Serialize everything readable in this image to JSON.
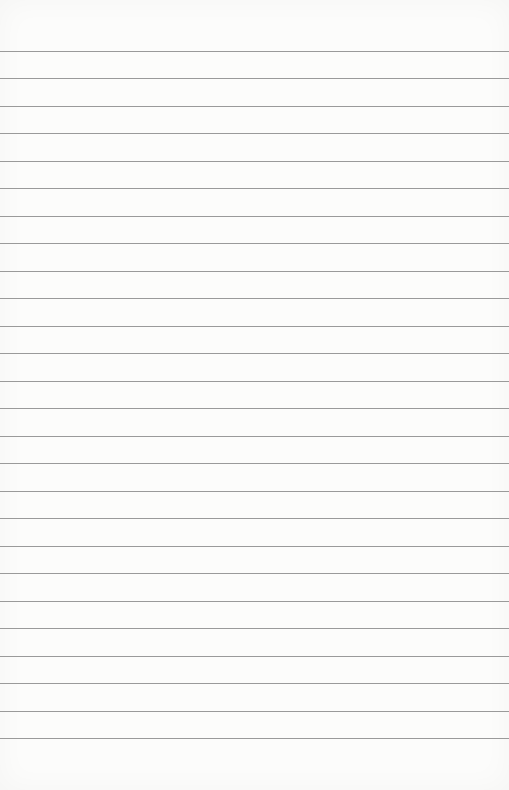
{
  "page": {
    "type": "lined-paper",
    "background_color": "#fcfcfb",
    "line_color": "#8f8f8f",
    "line_count": 26,
    "first_line_y": 51,
    "line_spacing": 27.48,
    "text_content": ""
  }
}
